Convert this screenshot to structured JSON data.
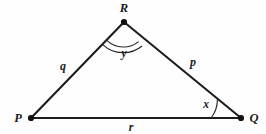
{
  "figure": {
    "kind": "geometry-diagram",
    "shape": "triangle",
    "background_color": "#fefefe",
    "stroke_color": "#1d1d1d",
    "text_color": "#1b1b1b"
  },
  "vertices": [
    {
      "id": "R",
      "label": "R",
      "x": 124,
      "y": 22,
      "label_x": 124,
      "label_y": 12,
      "dot_radius": 3.1
    },
    {
      "id": "P",
      "label": "P",
      "x": 31,
      "y": 118,
      "label_x": 18,
      "label_y": 122,
      "dot_radius": 3.1
    },
    {
      "id": "Q",
      "label": "Q",
      "x": 241,
      "y": 118,
      "label_x": 254,
      "label_y": 122,
      "dot_radius": 3.1
    }
  ],
  "sides": [
    {
      "id": "q",
      "label": "q",
      "from": "P",
      "to": "R",
      "label_x": 63,
      "label_y": 70
    },
    {
      "id": "p",
      "label": "p",
      "from": "R",
      "to": "Q",
      "label_x": 193,
      "label_y": 66
    },
    {
      "id": "r",
      "label": "r",
      "from": "P",
      "to": "Q",
      "label_x": 131,
      "label_y": 131
    }
  ],
  "angles": [
    {
      "id": "y",
      "label": "y",
      "at_vertex": "R",
      "marker": "double-arc",
      "arc_count": 2,
      "label_x": 124,
      "label_y": 57
    },
    {
      "id": "x",
      "label": "x",
      "at_vertex": "Q",
      "marker": "single-arc",
      "arc_count": 1,
      "label_x": 206,
      "label_y": 108
    }
  ]
}
